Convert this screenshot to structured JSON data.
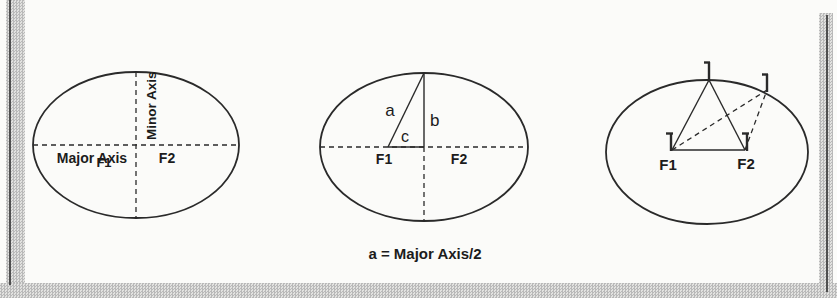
{
  "colors": {
    "ink": "#2a2a2a",
    "text": "#1c1c1c",
    "band_fill": "#c9c9c9",
    "band_line": "#4f4f4f",
    "background": "#fbfbf9"
  },
  "panel_axes": {
    "minor_axis": "Minor Axis",
    "major_axis": "Major Axis",
    "f1": "F1",
    "f2": "F2"
  },
  "panel_abc": {
    "a": "a",
    "b": "b",
    "c": "c",
    "f1": "F1",
    "f2": "F2"
  },
  "panel_pins": {
    "f1": "F1",
    "f2": "F2"
  },
  "caption": "a = Major Axis/2"
}
